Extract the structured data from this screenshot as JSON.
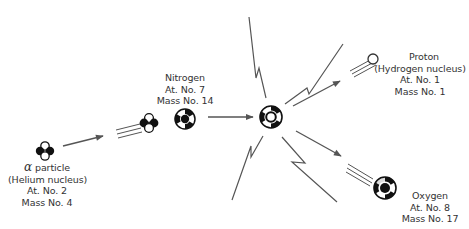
{
  "diagram": {
    "colors": {
      "line": "#555555",
      "nucleus": "#111111",
      "background": "#ffffff"
    },
    "particles": {
      "alpha": {
        "symbol": "α",
        "name": "particle",
        "subtitle": "(Helium nucleus)",
        "atomic": "At. No. 2",
        "mass": "Mass No. 4"
      },
      "nitrogen": {
        "name": "Nitrogen",
        "atomic": "At. No. 7",
        "mass": "Mass No. 14"
      },
      "proton": {
        "name": "Proton",
        "subtitle": "(Hydrogen nucleus)",
        "atomic": "At. No. 1",
        "mass": "Mass No. 1"
      },
      "oxygen": {
        "name": "Oxygen",
        "atomic": "At. No. 8",
        "mass": "Mass No. 17"
      }
    },
    "icons": [
      "alpha-nucleus-icon",
      "nitrogen-nucleus-icon",
      "compound-nucleus-icon",
      "proton-icon",
      "oxygen-nucleus-icon",
      "lightning-bolt-icon",
      "arrow-icon",
      "speed-lines-icon"
    ]
  }
}
